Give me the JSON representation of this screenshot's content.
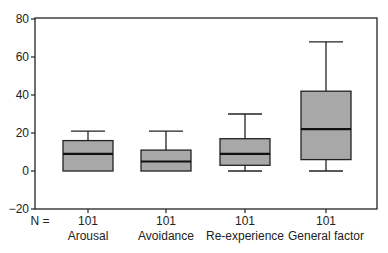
{
  "chart_data": {
    "type": "boxplot",
    "title": "",
    "xlabel": "",
    "ylabel": "",
    "ylim": [
      -20,
      80
    ],
    "yticks": [
      80,
      60,
      40,
      20,
      0,
      -20
    ],
    "yticks_labels": [
      "80",
      "60",
      "40",
      "20",
      "0",
      "−20"
    ],
    "grid": false,
    "n_label": "N =",
    "categories": [
      "Arousal",
      "Avoidance",
      "Re-experience",
      "General factor"
    ],
    "n": [
      "101",
      "101",
      "101",
      "101"
    ],
    "series": [
      {
        "name": "Arousal",
        "n": 101,
        "min": 0,
        "q1": 0,
        "median": 9,
        "q3": 16,
        "max": 21
      },
      {
        "name": "Avoidance",
        "n": 101,
        "min": 0,
        "q1": 0,
        "median": 5,
        "q3": 11,
        "max": 21
      },
      {
        "name": "Re-experience",
        "n": 101,
        "min": 0,
        "q1": 3,
        "median": 9,
        "q3": 17,
        "max": 30
      },
      {
        "name": "General factor",
        "n": 101,
        "min": 0,
        "q1": 6,
        "median": 22,
        "q3": 42,
        "max": 68
      }
    ],
    "box_color": "#a8a8a8",
    "line_color": "#222222"
  }
}
